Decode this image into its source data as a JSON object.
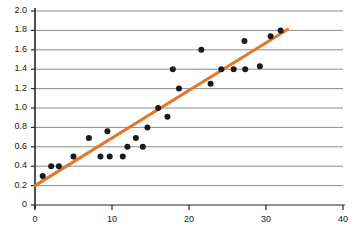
{
  "chart_data": {
    "type": "scatter",
    "title": "",
    "subtitle": "",
    "xlabel": "",
    "ylabel": "",
    "xlim": [
      0,
      40
    ],
    "ylim": [
      0,
      2.0
    ],
    "xticks": [
      0,
      10,
      20,
      30,
      40
    ],
    "xtick_labels": [
      "0",
      "10",
      "20",
      "30",
      "40"
    ],
    "yticks": [
      0,
      0.2,
      0.4,
      0.6,
      0.8,
      1.0,
      1.2,
      1.4,
      1.6,
      1.8,
      2.0
    ],
    "ytick_labels": [
      "0",
      "0.2",
      "0.4",
      "0.6",
      "0.8",
      "1.0",
      "1.2",
      "1.4",
      "1.6",
      "1.8",
      "2.0"
    ],
    "grid": {
      "horizontal": true,
      "vertical": false,
      "color": "#8c8c8c"
    },
    "legend": {
      "visible": false,
      "position": "none",
      "entries": []
    },
    "annotations": [],
    "series": [
      {
        "name": "observations",
        "type": "scatter",
        "marker": "circle",
        "color": "#1a1a1a",
        "marker_size": 3,
        "points": [
          [
            1.0,
            0.3
          ],
          [
            2.1,
            0.4
          ],
          [
            3.1,
            0.4
          ],
          [
            5.0,
            0.5
          ],
          [
            7.0,
            0.69
          ],
          [
            8.5,
            0.5
          ],
          [
            9.4,
            0.76
          ],
          [
            9.7,
            0.5
          ],
          [
            11.4,
            0.5
          ],
          [
            12.0,
            0.6
          ],
          [
            13.1,
            0.69
          ],
          [
            14.0,
            0.6
          ],
          [
            14.6,
            0.8
          ],
          [
            16.0,
            1.0
          ],
          [
            17.2,
            0.91
          ],
          [
            17.9,
            1.4
          ],
          [
            18.7,
            1.2
          ],
          [
            21.6,
            1.6
          ],
          [
            22.8,
            1.25
          ],
          [
            24.2,
            1.4
          ],
          [
            25.8,
            1.4
          ],
          [
            27.2,
            1.69
          ],
          [
            27.3,
            1.4
          ],
          [
            29.2,
            1.43
          ],
          [
            30.6,
            1.74
          ],
          [
            31.9,
            1.8
          ]
        ]
      },
      {
        "name": "trend-line",
        "type": "line",
        "color": "#e0792d",
        "line_width": 3,
        "points": [
          [
            0.0,
            0.2
          ],
          [
            32.8,
            1.81
          ]
        ]
      }
    ],
    "axis_color": "#262626",
    "plot_background": "#ffffff"
  },
  "geometry": {
    "plot_left_px": 35,
    "plot_right_px": 343,
    "plot_top_px": 11,
    "plot_bottom_px": 205,
    "y_top_value": 2.0,
    "y_bottom_value": 0.0,
    "x_left_value": 0,
    "x_right_value": 40
  }
}
